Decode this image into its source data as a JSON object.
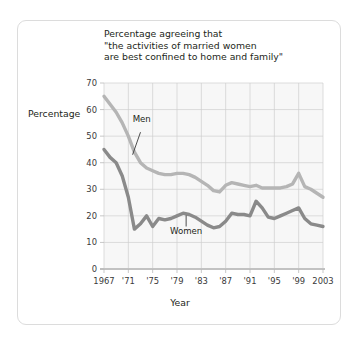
{
  "card": {
    "border_color": "#dcdcdc",
    "background": "#ffffff"
  },
  "chart_data": {
    "type": "line",
    "title": "Percentage agreeing that\n\"the activities of married women\nare best confined to home and family\"",
    "xlabel": "Year",
    "ylabel": "Percentage",
    "xlim": [
      1967,
      2003
    ],
    "ylim": [
      0,
      70
    ],
    "grid": true,
    "legend_position": "inline-annotation",
    "y_ticks": [
      0,
      10,
      20,
      30,
      40,
      50,
      60,
      70
    ],
    "y_tick_labels": [
      "0",
      "10",
      "20",
      "30",
      "40",
      "50",
      "60",
      "70"
    ],
    "x_ticks": [
      1967,
      1971,
      1975,
      1979,
      1983,
      1987,
      1991,
      1995,
      1999,
      2003
    ],
    "x_tick_labels": [
      "1967",
      "'71",
      "'75",
      "'79",
      "'83",
      "'87",
      "'91",
      "'95",
      "'99",
      "2003"
    ],
    "plot_background": "#f7f7f7",
    "grid_color": "#cfcfcf",
    "series": [
      {
        "name": "Men",
        "color": "#b5b5b5",
        "label_x": 1973.2,
        "label_y": 55.5,
        "leader_from": [
          1973.0,
          51.5
        ],
        "leader_to": [
          1971.7,
          43.0
        ],
        "x": [
          1967,
          1968,
          1969,
          1970,
          1971,
          1972,
          1973,
          1974,
          1975,
          1976,
          1977,
          1978,
          1979,
          1980,
          1981,
          1982,
          1983,
          1984,
          1985,
          1986,
          1987,
          1988,
          1989,
          1990,
          1991,
          1992,
          1993,
          1994,
          1995,
          1996,
          1997,
          1998,
          1999,
          2000,
          2001,
          2002,
          2003
        ],
        "values": [
          65,
          62,
          59,
          55,
          50,
          44,
          40,
          38,
          37,
          36,
          35.5,
          35.5,
          36,
          36,
          35.5,
          34.5,
          33,
          31.5,
          29.5,
          29,
          31.5,
          32.5,
          32,
          31.5,
          31,
          31.5,
          30.5,
          30.5,
          30.5,
          30.5,
          31,
          32,
          36,
          31,
          30,
          28.5,
          27
        ]
      },
      {
        "name": "Women",
        "color": "#8a8a8a",
        "label_x": 1980.5,
        "label_y": 13.2,
        "leader_from": [
          1980.5,
          16.0
        ],
        "leader_to": [
          1980.5,
          20.2
        ],
        "x": [
          1967,
          1968,
          1969,
          1970,
          1971,
          1972,
          1973,
          1974,
          1975,
          1976,
          1977,
          1978,
          1979,
          1980,
          1981,
          1982,
          1983,
          1984,
          1985,
          1986,
          1987,
          1988,
          1989,
          1990,
          1991,
          1992,
          1993,
          1994,
          1995,
          1996,
          1997,
          1998,
          1999,
          2000,
          2001,
          2002,
          2003
        ],
        "values": [
          45,
          42,
          40,
          35,
          27,
          15,
          17,
          20,
          16,
          19,
          18.5,
          19,
          20,
          21,
          20.5,
          19.5,
          18,
          16.5,
          15.5,
          16,
          18,
          21,
          20.5,
          20.5,
          20,
          25.5,
          23,
          19.5,
          19,
          20,
          21,
          22,
          23,
          19,
          17,
          16.5,
          16
        ]
      }
    ]
  }
}
